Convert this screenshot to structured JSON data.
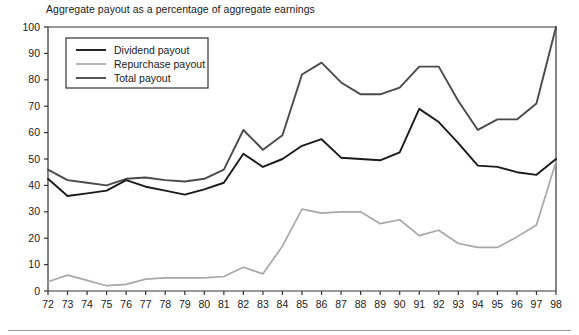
{
  "chart_data": {
    "type": "line",
    "title": "Aggregate payout as a percentage of aggregate earnings",
    "xlabel": "",
    "ylabel": "",
    "xlim": [
      72,
      98
    ],
    "ylim": [
      0,
      100
    ],
    "ytick_step": 10,
    "grid": false,
    "legend_position": "top-left",
    "categories": [
      "72",
      "73",
      "74",
      "75",
      "76",
      "77",
      "78",
      "79",
      "80",
      "81",
      "82",
      "83",
      "84",
      "85",
      "86",
      "87",
      "88",
      "89",
      "90",
      "91",
      "92",
      "93",
      "94",
      "95",
      "96",
      "97",
      "98"
    ],
    "yticks": [
      "0",
      "10",
      "20",
      "30",
      "40",
      "50",
      "60",
      "70",
      "80",
      "90",
      "100"
    ],
    "series": [
      {
        "name": "Dividend payout",
        "color": "#1a1a1a",
        "values": [
          42.5,
          36,
          37,
          38,
          42,
          39.5,
          38,
          36.5,
          38.5,
          41,
          52,
          47,
          50,
          55,
          57.5,
          50.5,
          50,
          49.5,
          52.5,
          69,
          64,
          56,
          47.5,
          47,
          45,
          44,
          50
        ]
      },
      {
        "name": "Repurchase payout",
        "color": "#a8a8a8",
        "values": [
          3.5,
          6,
          4,
          2,
          2.5,
          4.5,
          5,
          5,
          5,
          5.5,
          9,
          6.5,
          17,
          31,
          29.5,
          30,
          30,
          25.5,
          27,
          21,
          23,
          18,
          16.5,
          16.5,
          20.5,
          25,
          49
        ]
      },
      {
        "name": "Total payout",
        "color": "#4a4a4a",
        "values": [
          46,
          42,
          41,
          40,
          42.5,
          43,
          42,
          41.5,
          42.5,
          46,
          61,
          53.5,
          59,
          82,
          86.5,
          79,
          74.5,
          74.5,
          77,
          85,
          85,
          72,
          61,
          65,
          65,
          71,
          100
        ]
      }
    ]
  },
  "legend": {
    "items": [
      {
        "label": "Dividend payout"
      },
      {
        "label": "Repurchase payout"
      },
      {
        "label": "Total payout"
      }
    ]
  }
}
